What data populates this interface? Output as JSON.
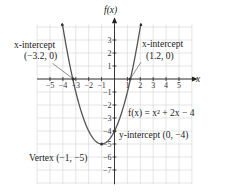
{
  "chart_data": {
    "type": "line",
    "title": "",
    "xlabel": "x",
    "ylabel": "f(x)",
    "function": "f(x) = x^2 + 2x - 4",
    "function_label": "f(x) = x² + 2x − 4",
    "xlim": [
      -6,
      6
    ],
    "ylim": [
      -8,
      4.5
    ],
    "grid": true,
    "x_ticks": [
      -5,
      -4,
      -3,
      -2,
      -1,
      1,
      2,
      3,
      4,
      5
    ],
    "y_ticks": [
      3,
      2,
      1,
      -1,
      -2,
      -3,
      -4,
      -5,
      -6,
      -7
    ],
    "x_tick_labels": [
      "−5",
      "−4",
      "−3",
      "−2",
      "−1",
      "1",
      "2",
      "3",
      "4",
      "5"
    ],
    "y_tick_labels": [
      "3",
      "2",
      "1",
      "−1",
      "−2",
      "−3",
      "−4",
      "−5",
      "−6",
      "−7"
    ],
    "series": [
      {
        "name": "f(x) = x^2 + 2x - 4",
        "x": [
          -4,
          -3.5,
          -3,
          -2.5,
          -2,
          -1.5,
          -1,
          -0.5,
          0,
          0.5,
          1,
          1.5,
          2
        ],
        "values": [
          4,
          1.25,
          -1,
          -2.75,
          -4,
          -4.75,
          -5,
          -4.75,
          -4,
          -2.75,
          -1,
          1.25,
          4
        ]
      }
    ],
    "annotations": [
      {
        "name": "x-intercept-left",
        "line1": "x-intercept",
        "line2": "(−3.2, 0)",
        "x": -3.2,
        "y": 0
      },
      {
        "name": "x-intercept-right",
        "line1": "x-intercept",
        "line2": "(1.2, 0)",
        "x": 1.2,
        "y": 0
      },
      {
        "name": "vertex",
        "text": "Vertex (−1, −5)",
        "x": -1,
        "y": -5
      },
      {
        "name": "y-intercept",
        "text": "y-intercept (0, −4)",
        "x": 0,
        "y": -4
      }
    ]
  },
  "labels": {
    "x_axis": "x",
    "y_axis": "f(x)",
    "function": "f(x) = x² + 2x − 4",
    "xint_left_1": "x-intercept",
    "xint_left_2": "(−3.2, 0)",
    "xint_right_1": "x-intercept",
    "xint_right_2": "(1.2, 0)",
    "vertex": "Vertex (−1, −5)",
    "yint": "y-intercept (0, −4)"
  }
}
